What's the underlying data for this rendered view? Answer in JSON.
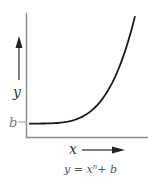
{
  "diagram": {
    "y_axis_label": "y",
    "x_axis_label": "x",
    "intercept_label": "b",
    "equation": {
      "lhs": "y",
      "equals": " = ",
      "base": "x",
      "exponent": "n",
      "plus": "+ ",
      "constant": "b"
    },
    "curve": {
      "description": "y = x^n + b, starting at intercept b and rising steeply",
      "exponent_sample": 4,
      "intercept": 0.13,
      "x_range": [
        0,
        1
      ],
      "y_range": [
        0,
        1.15
      ]
    },
    "colors": {
      "axis": "#8a8a8a",
      "curve": "#1a1a1a",
      "arrow": "#333333",
      "text": "#333333",
      "b_label": "#777777"
    }
  }
}
